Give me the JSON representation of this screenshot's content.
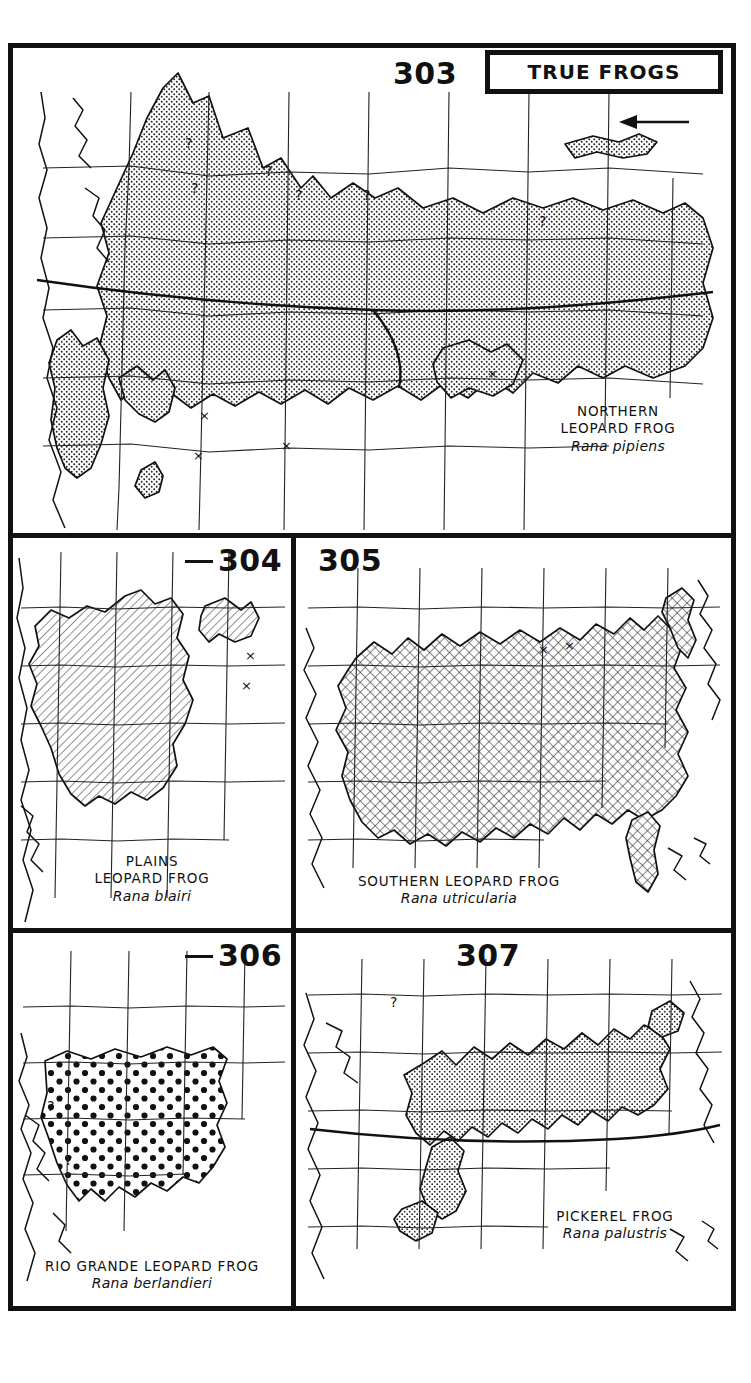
{
  "plate": {
    "title": "TRUE FROGS",
    "group_label": "TRUE FROGS"
  },
  "panels": [
    {
      "number": "303",
      "common_name_line1": "NORTHERN",
      "common_name_line2": "LEOPARD FROG",
      "scientific_name": "Rana pipiens",
      "fill_pattern": "stipple",
      "map_extent": "North America",
      "markers": {
        "question_marks": 6,
        "x_marks": 4,
        "arrow": 1
      }
    },
    {
      "number": "304",
      "common_name_line1": "PLAINS",
      "common_name_line2": "LEOPARD FROG",
      "scientific_name": "Rana blairi",
      "fill_pattern": "diagonal-hatch",
      "map_extent": "Central United States",
      "markers": {
        "question_marks": 0,
        "x_marks": 2,
        "arrow": 0
      }
    },
    {
      "number": "305",
      "common_name_line1": "SOUTHERN LEOPARD FROG",
      "common_name_line2": "",
      "scientific_name": "Rana utricularia",
      "fill_pattern": "cross-hatch",
      "map_extent": "Eastern United States",
      "markers": {
        "question_marks": 0,
        "x_marks": 2,
        "arrow": 0
      }
    },
    {
      "number": "306",
      "common_name_line1": "RIO GRANDE LEOPARD FROG",
      "common_name_line2": "",
      "scientific_name": "Rana berlandieri",
      "fill_pattern": "bold-dots",
      "map_extent": "Southwestern United States and Mexico",
      "markers": {
        "question_marks": 2,
        "x_marks": 0,
        "arrow": 0
      }
    },
    {
      "number": "307",
      "common_name_line1": "PICKEREL FROG",
      "common_name_line2": "",
      "scientific_name": "Rana palustris",
      "fill_pattern": "stipple",
      "map_extent": "Eastern United States",
      "markers": {
        "question_marks": 1,
        "x_marks": 0,
        "arrow": 0
      }
    }
  ],
  "colors": {
    "ink": "#111111",
    "paper": "#ffffff",
    "range_fill": "#8c8c8c"
  }
}
